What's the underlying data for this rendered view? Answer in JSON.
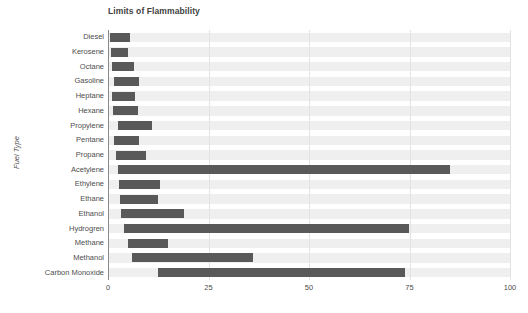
{
  "chart_data": {
    "type": "bar",
    "orientation": "horizontal",
    "bar_style": "floating-range",
    "title": "Limits of Flammability",
    "xlabel": "",
    "ylabel": "Fuel Type",
    "xlim": [
      0,
      100
    ],
    "xticks": [
      0,
      25,
      50,
      75,
      100
    ],
    "xtick_labels": [
      "0",
      "25",
      "50",
      "75",
      "100"
    ],
    "grid": true,
    "legend": "none",
    "bar_color": "#595959",
    "band_color": "#efefef",
    "categories": [
      "Diesel",
      "Kerosene",
      "Octane",
      "Gasoline",
      "Heptane",
      "Hexane",
      "Propylene",
      "Pentane",
      "Propane",
      "Acetylene",
      "Ethylene",
      "Ethane",
      "Ethanol",
      "Hydrogren",
      "Methane",
      "Methanol",
      "Carbon Monoxide"
    ],
    "series": [
      {
        "name": "Lower Flammability Limit",
        "values": [
          0.6,
          0.7,
          1.0,
          1.4,
          1.1,
          1.2,
          2.4,
          1.5,
          2.1,
          2.5,
          2.7,
          3.0,
          3.3,
          4.0,
          5.0,
          6.0,
          12.5
        ]
      },
      {
        "name": "Upper Flammability Limit",
        "values": [
          5.5,
          5.0,
          6.5,
          7.6,
          6.7,
          7.5,
          11.0,
          7.8,
          9.5,
          85.0,
          36.0,
          12.5,
          19.0,
          75.0,
          15.0,
          36.0,
          74.0
        ]
      }
    ],
    "bars": [
      {
        "category": "Diesel",
        "low": 0.6,
        "high": 5.5
      },
      {
        "category": "Kerosene",
        "low": 0.7,
        "high": 5.0
      },
      {
        "category": "Octane",
        "low": 1.0,
        "high": 6.5
      },
      {
        "category": "Gasoline",
        "low": 1.4,
        "high": 7.6
      },
      {
        "category": "Heptane",
        "low": 1.1,
        "high": 6.7
      },
      {
        "category": "Hexane",
        "low": 1.2,
        "high": 7.5
      },
      {
        "category": "Propylene",
        "low": 2.4,
        "high": 11.0
      },
      {
        "category": "Pentane",
        "low": 1.5,
        "high": 7.8
      },
      {
        "category": "Propane",
        "low": 2.1,
        "high": 9.5
      },
      {
        "category": "Acetylene",
        "low": 2.5,
        "high": 85.0
      },
      {
        "category": "Ethylene",
        "low": 2.7,
        "high": 13.0
      },
      {
        "category": "Ethane",
        "low": 3.0,
        "high": 12.5
      },
      {
        "category": "Ethanol",
        "low": 3.3,
        "high": 19.0
      },
      {
        "category": "Hydrogren",
        "low": 4.0,
        "high": 75.0
      },
      {
        "category": "Methane",
        "low": 5.0,
        "high": 15.0
      },
      {
        "category": "Methanol",
        "low": 6.0,
        "high": 36.0
      },
      {
        "category": "Carbon Monoxide",
        "low": 12.5,
        "high": 74.0
      }
    ]
  }
}
